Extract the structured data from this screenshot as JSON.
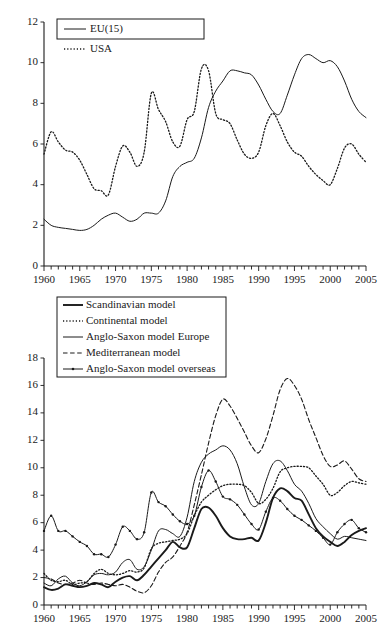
{
  "figure": {
    "title": "",
    "panels": [
      "chart-top",
      "chart-bottom"
    ]
  },
  "chart_data": [
    {
      "id": "top",
      "type": "line",
      "title": "",
      "xlabel": "",
      "ylabel": "",
      "xlim": [
        1960,
        2005
      ],
      "ylim": [
        0,
        12
      ],
      "yticks": [
        0,
        2,
        4,
        6,
        8,
        10,
        12
      ],
      "xticks_major": [
        1960,
        1965,
        1970,
        1975,
        1980,
        1985,
        1990,
        1995,
        2000,
        2005
      ],
      "xtick_step_minor": 1,
      "grid": false,
      "legend_position": "top-left",
      "x": [
        1960,
        1961,
        1962,
        1963,
        1964,
        1965,
        1966,
        1967,
        1968,
        1969,
        1970,
        1971,
        1972,
        1973,
        1974,
        1975,
        1976,
        1977,
        1978,
        1979,
        1980,
        1981,
        1982,
        1983,
        1984,
        1985,
        1986,
        1987,
        1988,
        1989,
        1990,
        1991,
        1992,
        1993,
        1994,
        1995,
        1996,
        1997,
        1998,
        1999,
        2000,
        2001,
        2002,
        2003,
        2004,
        2005
      ],
      "series": [
        {
          "name": "EU(15)",
          "style": "solid",
          "marker": "none",
          "values": [
            2.3,
            2.0,
            1.9,
            1.85,
            1.8,
            1.75,
            1.8,
            2.0,
            2.3,
            2.5,
            2.6,
            2.4,
            2.2,
            2.3,
            2.6,
            2.6,
            2.6,
            3.2,
            4.4,
            4.9,
            5.1,
            5.3,
            6.3,
            7.8,
            8.6,
            9.1,
            9.6,
            9.6,
            9.5,
            9.4,
            8.9,
            8.2,
            7.6,
            7.5,
            8.4,
            9.4,
            10.2,
            10.4,
            10.2,
            10.0,
            10.1,
            9.8,
            9.1,
            8.2,
            7.6,
            7.3,
            7.3,
            7.8,
            8.0,
            8.2,
            8.1,
            7.9
          ]
        },
        {
          "name": "USA",
          "style": "dotted",
          "marker": "none",
          "values": [
            5.5,
            6.6,
            6.1,
            5.7,
            5.6,
            5.2,
            4.5,
            3.8,
            3.7,
            3.5,
            4.9,
            5.9,
            5.6,
            4.9,
            5.6,
            8.5,
            7.7,
            7.1,
            6.1,
            5.9,
            7.2,
            7.6,
            9.7,
            9.6,
            7.5,
            7.2,
            7.0,
            6.2,
            5.5,
            5.3,
            5.6,
            6.9,
            7.5,
            6.9,
            6.1,
            5.6,
            5.4,
            4.9,
            4.5,
            4.2,
            4.0,
            4.8,
            5.8,
            6.0,
            5.5,
            5.1
          ]
        }
      ]
    },
    {
      "id": "bottom",
      "type": "line",
      "title": "",
      "xlabel": "",
      "ylabel": "",
      "xlim": [
        1960,
        2005
      ],
      "ylim": [
        0,
        18
      ],
      "yticks": [
        0,
        2,
        4,
        6,
        8,
        10,
        12,
        14,
        16,
        18
      ],
      "xticks_major": [
        1960,
        1965,
        1970,
        1975,
        1980,
        1985,
        1990,
        1995,
        2000,
        2005
      ],
      "xtick_step_minor": 1,
      "grid": false,
      "legend_position": "top-left",
      "x": [
        1960,
        1961,
        1962,
        1963,
        1964,
        1965,
        1966,
        1967,
        1968,
        1969,
        1970,
        1971,
        1972,
        1973,
        1974,
        1975,
        1976,
        1977,
        1978,
        1979,
        1980,
        1981,
        1982,
        1983,
        1984,
        1985,
        1986,
        1987,
        1988,
        1989,
        1990,
        1991,
        1992,
        1993,
        1994,
        1995,
        1996,
        1997,
        1998,
        1999,
        2000,
        2001,
        2002,
        2003,
        2004,
        2005
      ],
      "series": [
        {
          "name": "Scandinavian model",
          "style": "solid-thick",
          "marker": "none",
          "values": [
            1.3,
            1.1,
            1.2,
            1.5,
            1.4,
            1.3,
            1.4,
            1.6,
            1.5,
            1.3,
            1.7,
            2.0,
            2.1,
            1.8,
            2.2,
            2.8,
            3.4,
            4.0,
            4.6,
            4.2,
            4.2,
            5.6,
            7.0,
            7.1,
            6.5,
            5.6,
            5.0,
            4.8,
            4.8,
            4.9,
            4.7,
            6.0,
            7.8,
            8.5,
            8.3,
            7.8,
            7.6,
            6.6,
            5.6,
            5.0,
            4.6,
            4.3,
            4.6,
            5.1,
            5.4,
            5.6
          ]
        },
        {
          "name": "Continental model",
          "style": "dotted",
          "marker": "none",
          "values": [
            2.3,
            1.8,
            1.7,
            1.8,
            1.5,
            1.6,
            1.7,
            2.3,
            2.6,
            2.3,
            2.2,
            2.3,
            2.5,
            2.4,
            2.7,
            4.1,
            4.5,
            4.6,
            4.7,
            4.8,
            5.2,
            6.5,
            7.5,
            8.0,
            8.4,
            8.7,
            8.8,
            8.8,
            8.7,
            8.2,
            7.4,
            7.7,
            8.5,
            9.7,
            10.0,
            10.1,
            10.1,
            10.0,
            9.4,
            8.8,
            8.0,
            8.2,
            8.7,
            9.0,
            8.9,
            8.8
          ]
        },
        {
          "name": "Anglo-Saxon model Europe",
          "style": "solid",
          "marker": "none",
          "values": [
            1.6,
            1.4,
            1.9,
            2.1,
            1.6,
            1.4,
            1.7,
            2.2,
            2.3,
            2.2,
            2.4,
            3.1,
            3.3,
            2.6,
            2.8,
            4.0,
            5.4,
            5.5,
            5.2,
            5.0,
            6.4,
            9.0,
            10.4,
            11.0,
            11.3,
            11.6,
            11.3,
            10.3,
            8.6,
            7.3,
            7.4,
            9.0,
            10.3,
            10.5,
            9.8,
            8.8,
            8.3,
            7.4,
            6.3,
            5.7,
            5.2,
            4.8,
            5.0,
            4.9,
            4.8,
            4.7
          ]
        },
        {
          "name": "Mediterranean model",
          "style": "dashed",
          "marker": "none",
          "values": [
            2.0,
            1.9,
            1.6,
            1.5,
            1.6,
            1.8,
            1.6,
            1.5,
            1.6,
            1.5,
            1.4,
            1.5,
            1.3,
            1.0,
            0.9,
            1.4,
            2.4,
            3.1,
            3.5,
            4.3,
            5.3,
            7.3,
            9.5,
            11.8,
            13.8,
            15.0,
            14.5,
            13.6,
            12.6,
            11.6,
            11.1,
            12.1,
            13.8,
            15.7,
            16.5,
            16.0,
            15.0,
            13.5,
            12.2,
            10.9,
            10.1,
            10.2,
            10.5,
            9.9,
            9.2,
            9.0
          ]
        },
        {
          "name": "Anglo-Saxon model overseas",
          "style": "solid-marker",
          "marker": "dot",
          "values": [
            5.4,
            6.5,
            5.4,
            5.4,
            5.0,
            4.6,
            4.3,
            3.7,
            3.7,
            3.5,
            4.4,
            5.7,
            5.4,
            4.8,
            5.3,
            8.2,
            7.5,
            7.2,
            6.6,
            6.1,
            5.9,
            6.5,
            8.6,
            9.8,
            9.0,
            7.9,
            7.7,
            7.3,
            6.6,
            5.9,
            5.5,
            6.8,
            7.8,
            7.6,
            7.0,
            6.5,
            6.2,
            5.8,
            5.4,
            4.9,
            4.4,
            5.3,
            5.9,
            6.2,
            5.6,
            5.3
          ]
        }
      ]
    }
  ],
  "legends": {
    "top": {
      "entries": [
        {
          "label": "EU(15)",
          "style": "solid"
        },
        {
          "label": "USA",
          "style": "dotted"
        }
      ]
    },
    "bottom": {
      "entries": [
        {
          "label": "Scandinavian model",
          "style": "solid-thick"
        },
        {
          "label": "Continental model",
          "style": "dotted"
        },
        {
          "label": "Anglo-Saxon model Europe",
          "style": "solid"
        },
        {
          "label": "Mediterranean model",
          "style": "dashed"
        },
        {
          "label": "Anglo-Saxon model overseas",
          "style": "solid-marker"
        }
      ]
    }
  },
  "colors": {
    "ink": "#1a1a1a",
    "background": "#ffffff"
  }
}
